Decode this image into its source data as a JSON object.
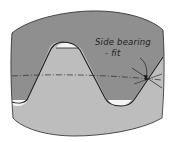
{
  "diagram": {
    "annotation": {
      "line1": "Side bearing",
      "line2": "- fit"
    },
    "colors": {
      "background": "#ffffff",
      "upper_member": "#8f8f8f",
      "lower_member": "#bdbdbd",
      "gap": "#f4f4f4",
      "outline": "#202020"
    }
  }
}
